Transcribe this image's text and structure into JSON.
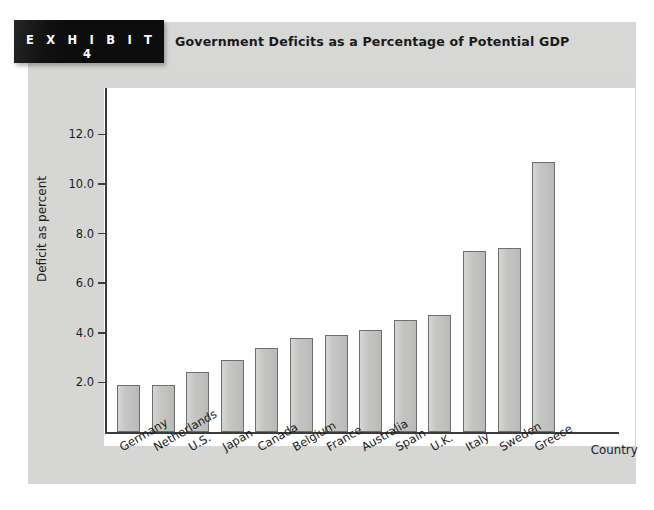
{
  "exhibit": {
    "tag_label": "E X H I B I T   4",
    "title": "Government Deficits as a Percentage of Potential GDP"
  },
  "colors": {
    "panel_background": "#d6d6d4",
    "plot_background": "#ffffff",
    "bar_fill": "#c3c3c1",
    "bar_border": "#6e6e6c",
    "axis": "#3c3c3c",
    "tag_background": "#0d0d0d",
    "text": "#1c1c1c"
  },
  "chart_data": {
    "type": "bar",
    "title": "Government Deficits as a Percentage of Potential GDP",
    "xlabel": "Country",
    "ylabel": "Deficit as percent",
    "ylim": [
      0,
      13
    ],
    "yticks": [
      2.0,
      4.0,
      6.0,
      8.0,
      10.0,
      12.0
    ],
    "ytick_labels": [
      "2.0",
      "4.0",
      "6.0",
      "8.0",
      "10.0",
      "12.0"
    ],
    "grid": false,
    "legend": "none",
    "categories": [
      "Germany",
      "Netherlands",
      "U.S.",
      "Japan",
      "Canada",
      "Belgium",
      "France",
      "Australia",
      "Spain",
      "U.K.",
      "Italy",
      "Sweden",
      "Greece"
    ],
    "values": [
      1.9,
      1.9,
      2.4,
      2.9,
      3.4,
      3.8,
      3.9,
      4.1,
      4.5,
      4.7,
      7.3,
      7.4,
      10.9
    ]
  }
}
